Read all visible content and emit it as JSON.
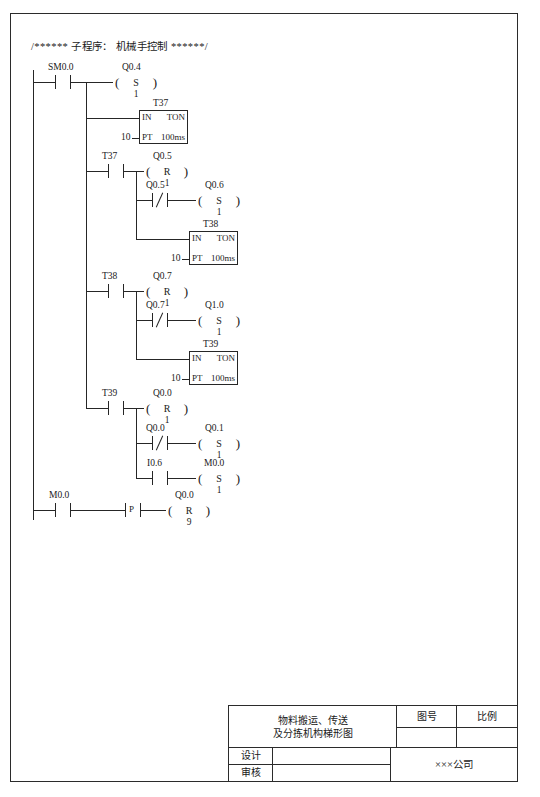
{
  "document": {
    "header_comment": "/****** 子程序： 机械手控制 ******/"
  },
  "ladder": {
    "rungs": [
      {
        "id": "rung-1",
        "contacts": [
          {
            "name": "SM0.0",
            "type": "no"
          }
        ],
        "coil": {
          "name": "Q0.4",
          "op": "S",
          "value": "1"
        },
        "timer": {
          "name": "T37",
          "in": "IN",
          "kind": "TON",
          "pt": "PT",
          "base": "100ms",
          "preset": "10"
        }
      },
      {
        "id": "rung-2",
        "contacts": [
          {
            "name": "T37",
            "type": "no"
          }
        ],
        "coil": {
          "name": "Q0.5",
          "op": "R",
          "value": "1"
        },
        "branch": {
          "contact": {
            "name": "Q0.5",
            "type": "nc"
          },
          "coil": {
            "name": "Q0.6",
            "op": "S",
            "value": "1"
          }
        },
        "timer": {
          "name": "T38",
          "in": "IN",
          "kind": "TON",
          "pt": "PT",
          "base": "100ms",
          "preset": "10"
        }
      },
      {
        "id": "rung-3",
        "contacts": [
          {
            "name": "T38",
            "type": "no"
          }
        ],
        "coil": {
          "name": "Q0.7",
          "op": "R",
          "value": "1"
        },
        "branch": {
          "contact": {
            "name": "Q0.7",
            "type": "nc"
          },
          "coil": {
            "name": "Q1.0",
            "op": "S",
            "value": "1"
          }
        },
        "timer": {
          "name": "T39",
          "in": "IN",
          "kind": "TON",
          "pt": "PT",
          "base": "100ms",
          "preset": "10"
        }
      },
      {
        "id": "rung-4",
        "contacts": [
          {
            "name": "T39",
            "type": "no"
          }
        ],
        "coil": {
          "name": "Q0.0",
          "op": "R",
          "value": "1"
        },
        "branch_a": {
          "contact": {
            "name": "Q0.0",
            "type": "nc"
          },
          "coil": {
            "name": "Q0.1",
            "op": "S",
            "value": "1"
          }
        },
        "branch_b": {
          "contact": {
            "name": "I0.6",
            "type": "no"
          },
          "coil": {
            "name": "M0.0",
            "op": "S",
            "value": "1"
          }
        }
      },
      {
        "id": "rung-5",
        "contacts": [
          {
            "name": "M0.0",
            "type": "no"
          },
          {
            "name": "",
            "type": "p",
            "glyph": "P"
          }
        ],
        "coil": {
          "name": "Q0.0",
          "op": "R",
          "value": "9"
        }
      }
    ]
  },
  "title_block": {
    "drawing_title_line1": "物料搬运、传送",
    "drawing_title_line2": "及分拣机构梯形图",
    "drawing_no_label": "图号",
    "drawing_no_value": "",
    "scale_label": "比例",
    "scale_value": "",
    "designer_label": "设计",
    "designer_value": "",
    "reviewer_label": "审核",
    "reviewer_value": "",
    "company": "×××公司"
  }
}
